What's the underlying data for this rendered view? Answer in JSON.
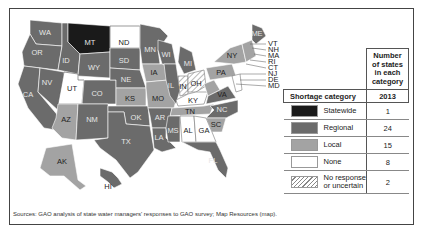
{
  "figure": {
    "source_note": "Sources: GAO analysis of state water managers' responses to GAO survey; Map Resources (map)."
  },
  "colors": {
    "statewide": "#1a1a1a",
    "regional": "#6b6b6b",
    "local": "#a3a3a3",
    "none": "#ffffff",
    "no_response": "hatched"
  },
  "legend": {
    "col_header_count": "Number of states in each category",
    "col_header_category": "Shortage category",
    "col_header_year": "2013",
    "rows": [
      {
        "category": "Statewide",
        "count": "1"
      },
      {
        "category": "Regional",
        "count": "24"
      },
      {
        "category": "Local",
        "count": "15"
      },
      {
        "category": "None",
        "count": "8"
      },
      {
        "category": "No response or uncertain",
        "category_line1": "No response",
        "category_line2": "or uncertain",
        "count": "2"
      }
    ]
  },
  "map": {
    "states": {
      "WA": "regional",
      "OR": "regional",
      "CA": "regional",
      "NV": "regional",
      "ID": "regional",
      "MT": "statewide",
      "WY": "regional",
      "UT": "none",
      "CO": "regional",
      "AZ": "local",
      "NM": "regional",
      "ND": "none",
      "SD": "regional",
      "NE": "regional",
      "KS": "local",
      "OK": "regional",
      "TX": "regional",
      "MN": "regional",
      "IA": "local",
      "MO": "local",
      "AR": "regional",
      "LA": "regional",
      "WI": "regional",
      "IL": "regional",
      "MI": "regional",
      "IN": "no_response",
      "OH": "no_response",
      "KY": "none",
      "TN": "local",
      "MS": "regional",
      "AL": "none",
      "GA": "none",
      "FL": "regional",
      "SC": "local",
      "NC": "regional",
      "VA": "regional",
      "WV": "local",
      "PA": "local",
      "NY": "local",
      "ME": "regional",
      "AK": "local",
      "HI": "regional"
    },
    "labels": [
      "WA",
      "OR",
      "CA",
      "NV",
      "ID",
      "MT",
      "WY",
      "UT",
      "CO",
      "AZ",
      "NM",
      "ND",
      "SD",
      "NE",
      "KS",
      "OK",
      "TX",
      "MN",
      "IA",
      "MO",
      "AR",
      "LA",
      "WI",
      "IL",
      "MI",
      "IN",
      "OH",
      "KY",
      "TN",
      "MS",
      "AL",
      "GA",
      "FL",
      "SC",
      "NC",
      "VA",
      "PA",
      "NY",
      "ME",
      "AK",
      "HI"
    ],
    "northeast_callouts": [
      "VT",
      "NH",
      "MA",
      "RI",
      "CT",
      "NJ",
      "DE",
      "MD"
    ]
  }
}
